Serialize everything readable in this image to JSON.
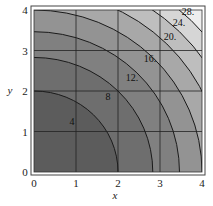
{
  "chart_data": {
    "type": "contour",
    "function": "x^2 + y^2",
    "xlabel": "x",
    "ylabel": "y",
    "xlim": [
      0,
      4
    ],
    "ylim": [
      0,
      4
    ],
    "xticks": [
      "0",
      "1",
      "2",
      "3",
      "4"
    ],
    "yticks": [
      "0",
      "1",
      "2",
      "3",
      "4"
    ],
    "grid": true,
    "levels": [
      4,
      8,
      12,
      16,
      20,
      24,
      28
    ],
    "level_labels": [
      "4",
      "8",
      "12.",
      "16.",
      "20.",
      "24.",
      "28."
    ],
    "fill_colors": [
      "#5c5c5c",
      "#6e6e6e",
      "#808080",
      "#939393",
      "#a8a8a8",
      "#bebebe",
      "#d6d6d6",
      "#eeeeee"
    ]
  }
}
